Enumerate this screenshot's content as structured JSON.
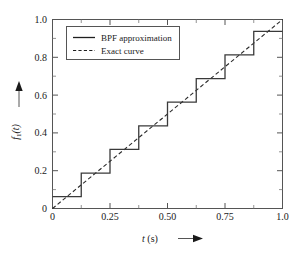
{
  "chart_data": {
    "type": "line",
    "title": "",
    "subtitle": "",
    "xlabel": "t (s)",
    "xlabel_symbol": "t",
    "xlabel_unit": "(s)",
    "ylabel": "f_1(t)",
    "ylabel_symbol": "f",
    "ylabel_subscript": "1",
    "ylabel_arg": "(t)",
    "xlim": [
      0,
      1.0
    ],
    "ylim": [
      0,
      1.0
    ],
    "grid": false,
    "legend_position": "upper-left-inside",
    "x_ticks": [
      0,
      0.25,
      0.5,
      0.75,
      1.0
    ],
    "x_tick_labels": [
      "0",
      "0.25",
      "0.50",
      "0.75",
      "1.0"
    ],
    "x_minor_ticks": [
      0.125,
      0.375,
      0.625,
      0.875
    ],
    "y_ticks": [
      0,
      0.2,
      0.4,
      0.6,
      0.8,
      1.0
    ],
    "y_tick_labels": [
      "0",
      "0.2",
      "0.4",
      "0.6",
      "0.8",
      "1.0"
    ],
    "y_minor_ticks": [
      0.1,
      0.3,
      0.5,
      0.7,
      0.9
    ],
    "n_blocks": 8,
    "block_width": 0.125,
    "series": [
      {
        "name": "BPF approximation",
        "style": "solid",
        "color": "#3a3a3a",
        "type": "step",
        "x_edges": [
          0,
          0.125,
          0.25,
          0.375,
          0.5,
          0.625,
          0.75,
          0.875,
          1.0
        ],
        "values": [
          0.0625,
          0.1875,
          0.3125,
          0.4375,
          0.5625,
          0.6875,
          0.8125,
          0.9375
        ]
      },
      {
        "name": "Exact curve",
        "style": "dashed",
        "color": "#2b2b2b",
        "type": "line",
        "x": [
          0,
          0.125,
          0.25,
          0.375,
          0.5,
          0.625,
          0.75,
          0.875,
          1.0
        ],
        "values": [
          0,
          0.125,
          0.25,
          0.375,
          0.5,
          0.625,
          0.75,
          0.875,
          1.0
        ]
      }
    ]
  },
  "legend": {
    "entries": [
      {
        "label": "BPF approximation",
        "style": "solid"
      },
      {
        "label": "Exact curve",
        "style": "dashed"
      }
    ]
  },
  "axes": {
    "x": {
      "label_symbol": "t",
      "label_unit": "(s)",
      "tick_labels": [
        "0",
        "0.25",
        "0.50",
        "0.75",
        "1.0"
      ]
    },
    "y": {
      "label_symbol": "f",
      "label_subscript": "1",
      "label_arg": "(t)",
      "tick_labels": [
        "0",
        "0.2",
        "0.4",
        "0.6",
        "0.8",
        "1.0"
      ]
    }
  },
  "colors": {
    "background": "#ffffff",
    "frame": "#555555",
    "bpf": "#3a3a3a",
    "exact": "#2b2b2b",
    "text": "#1a1a1a"
  }
}
